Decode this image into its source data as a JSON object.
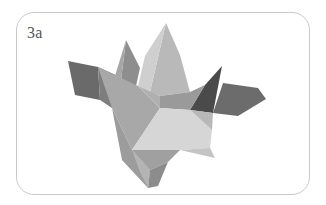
{
  "figure": {
    "label": "3a",
    "colors": {
      "border": "#c9c9c9",
      "label": "#555555",
      "facet_dark": "#5e5e5e",
      "facet_mid": "#8a8a8a",
      "facet_light": "#c8c8c8",
      "facet_lightest": "#dcdcdc"
    }
  }
}
